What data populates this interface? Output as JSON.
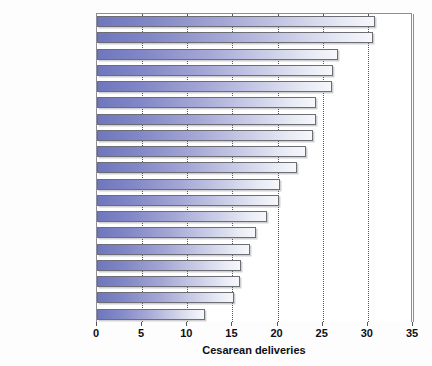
{
  "chart_data": {
    "type": "bar",
    "orientation": "horizontal",
    "title": "",
    "xlabel": "Cesarean deliveries",
    "ylabel": "",
    "xlim": [
      0,
      35
    ],
    "xticks": [
      0,
      5,
      10,
      15,
      20,
      25,
      30,
      35
    ],
    "grid": true,
    "grid_style": "dotted-vertical",
    "legend": "none",
    "categories": [
      "Italy",
      "Greece",
      "Australia",
      "United States",
      "N. Ireland",
      "Wales",
      "Scotland",
      "Germany",
      "Canada",
      "England",
      "Irish Republic",
      "Luxembourg",
      "Austria",
      "France",
      "Belgium",
      "Denmark",
      "Finland",
      "Sweden",
      "Netherlands"
    ],
    "values": [
      30.8,
      30.6,
      26.7,
      26.1,
      26.0,
      24.3,
      24.3,
      23.9,
      23.2,
      22.1,
      20.3,
      20.2,
      18.8,
      17.6,
      16.9,
      15.9,
      15.8,
      15.2,
      12.0
    ]
  },
  "colors": {
    "bar_gradient_start": "#6f77bd",
    "bar_gradient_end": "#f6f7fb",
    "bar_border": "#6d6d76",
    "axis_line": "#8e8e96",
    "gridline": "#55555c",
    "text": "#0d0d16",
    "background": "#ffffff"
  }
}
